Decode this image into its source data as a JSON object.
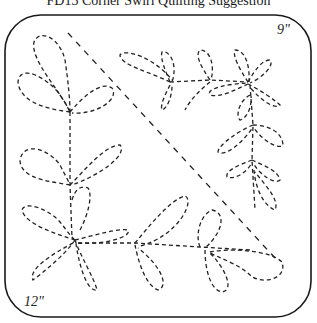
{
  "title": "FD13 Corner Swirl Quilting Suggestion",
  "dimensions": {
    "width_label": "9\"",
    "height_label": "12\""
  },
  "style": {
    "stroke_color": "#222222",
    "border_color": "#1a1a1a",
    "background": "#ffffff"
  },
  "elements": {
    "frame": "rounded-square-border",
    "diagonal": "dashed-diagonal-guide-line",
    "motif": "dashed-leaf-vine-corner-design"
  }
}
